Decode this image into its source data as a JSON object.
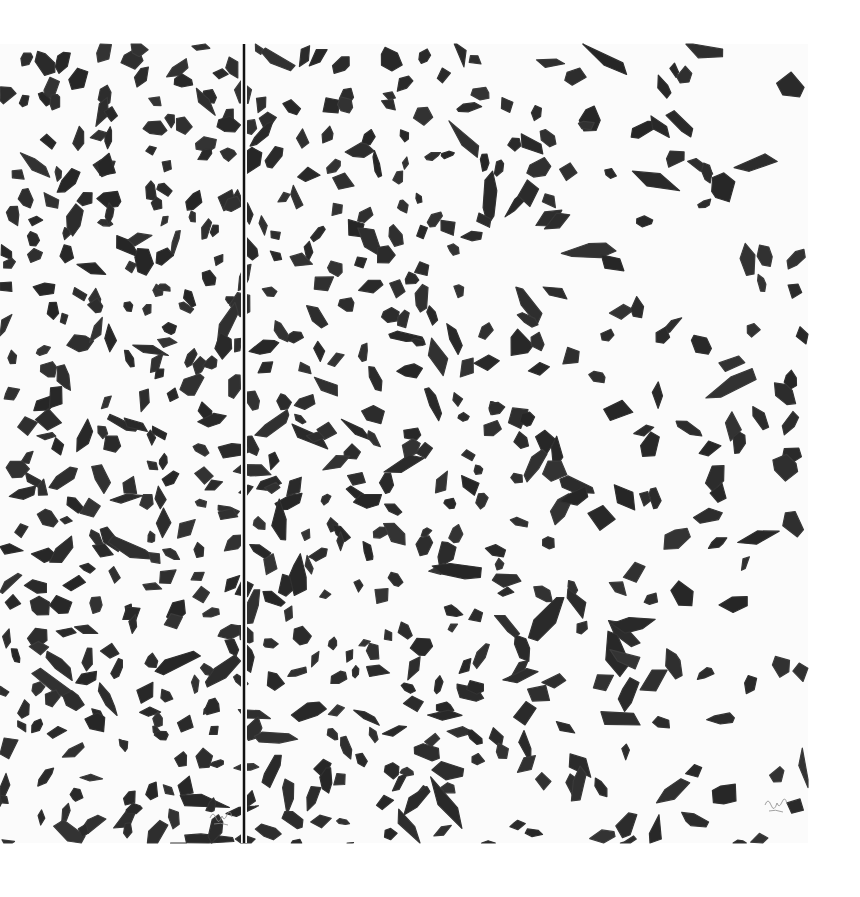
{
  "artwork": {
    "description": "Abstract diptych of black brush-stroke fragments on white canvas",
    "colors": {
      "background": "#ffffff",
      "canvas": "#fbfbfb",
      "paint": "#2b2b2b",
      "divider": "#111111",
      "signature": "#8a8a8a"
    },
    "canvas_bounds": {
      "x": 0,
      "y": 44,
      "width": 808,
      "height": 799
    },
    "divider_x": 244,
    "signatures": [
      {
        "panel": "left",
        "x": 210,
        "y": 818
      },
      {
        "panel": "right",
        "x": 765,
        "y": 805
      }
    ],
    "density": {
      "left_panel": "very dense",
      "right_panel_left": "dense",
      "right_panel_right": "sparse"
    }
  }
}
